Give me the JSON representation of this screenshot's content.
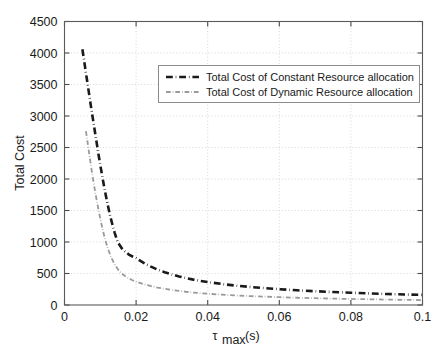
{
  "chart_data": {
    "type": "line",
    "title": "",
    "xlabel": "τ_max (s)",
    "xlabel_symbol": "τ",
    "xlabel_subscript": "max",
    "xlabel_units": "(s)",
    "ylabel": "Total Cost",
    "xlim": [
      0,
      0.1
    ],
    "ylim": [
      0,
      4500
    ],
    "xticks": [
      0,
      0.02,
      0.04,
      0.06,
      0.08,
      0.1
    ],
    "xticklabels": [
      "0",
      "0.02",
      "0.04",
      "0.06",
      "0.08",
      "0.1"
    ],
    "yticks": [
      0,
      500,
      1000,
      1500,
      2000,
      2500,
      3000,
      3500,
      4000,
      4500
    ],
    "yticklabels": [
      "0",
      "500",
      "1000",
      "1500",
      "2000",
      "2500",
      "3000",
      "3500",
      "4000",
      "4500"
    ],
    "grid": true,
    "legend_position": "upper center",
    "series": [
      {
        "name": "Total Cost of Constant Resource allocation",
        "color": "#1a1a1a",
        "linestyle": "dash-dot",
        "linewidth": 2.6,
        "x": [
          0.005,
          0.0055,
          0.006,
          0.0065,
          0.007,
          0.0075,
          0.008,
          0.0085,
          0.009,
          0.0095,
          0.01,
          0.0105,
          0.011,
          0.0115,
          0.012,
          0.0125,
          0.013,
          0.0135,
          0.014,
          0.0145,
          0.015,
          0.016,
          0.017,
          0.018,
          0.019,
          0.02,
          0.022,
          0.024,
          0.026,
          0.028,
          0.03,
          0.032,
          0.034,
          0.036,
          0.038,
          0.04,
          0.044,
          0.048,
          0.052,
          0.056,
          0.06,
          0.065,
          0.07,
          0.075,
          0.08,
          0.085,
          0.09,
          0.095,
          0.1
        ],
        "y": [
          4060,
          3870,
          3680,
          3490,
          3300,
          3110,
          2930,
          2750,
          2570,
          2390,
          2220,
          2060,
          1900,
          1750,
          1610,
          1480,
          1360,
          1250,
          1150,
          1060,
          985,
          900,
          845,
          800,
          770,
          745,
          672,
          612,
          562,
          520,
          484,
          453,
          427,
          403,
          382,
          364,
          333,
          307,
          286,
          267,
          251,
          233,
          219,
          206,
          195,
          184,
          175,
          167,
          160
        ]
      },
      {
        "name": "Total Cost of Dynamic Resource allocation",
        "color": "#9a9a9a",
        "linestyle": "dash-dot",
        "linewidth": 1.8,
        "x": [
          0.006,
          0.0065,
          0.007,
          0.0075,
          0.008,
          0.0085,
          0.009,
          0.0095,
          0.01,
          0.0105,
          0.011,
          0.0115,
          0.012,
          0.013,
          0.014,
          0.015,
          0.016,
          0.017,
          0.018,
          0.019,
          0.02,
          0.022,
          0.024,
          0.026,
          0.028,
          0.03,
          0.032,
          0.034,
          0.036,
          0.038,
          0.04,
          0.044,
          0.048,
          0.052,
          0.056,
          0.06,
          0.065,
          0.07,
          0.075,
          0.08,
          0.085,
          0.09,
          0.095,
          0.1
        ],
        "y": [
          2760,
          2560,
          2360,
          2170,
          1990,
          1820,
          1660,
          1510,
          1370,
          1240,
          1120,
          1010,
          915,
          760,
          645,
          560,
          500,
          455,
          420,
          393,
          370,
          332,
          302,
          277,
          256,
          238,
          223,
          210,
          198,
          188,
          179,
          164,
          151,
          141,
          132,
          124,
          115,
          108,
          101,
          96,
          91,
          86,
          82,
          78
        ]
      }
    ]
  },
  "axes": {
    "y_title": "Total Cost"
  },
  "legend": {
    "entries": [
      {
        "label": "Total Cost of Constant Resource allocation"
      },
      {
        "label": "Total Cost of Dynamic Resource allocation"
      }
    ]
  }
}
